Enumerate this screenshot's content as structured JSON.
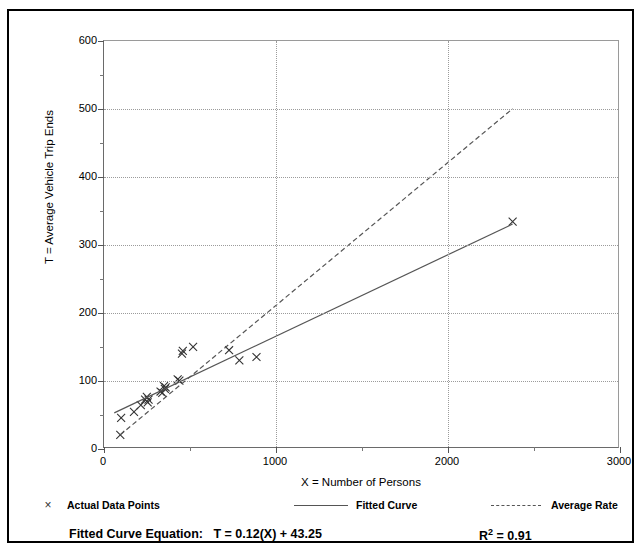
{
  "top_caption": "",
  "chart_data": {
    "type": "scatter",
    "title": "",
    "xlabel": "X = Number of Persons",
    "ylabel": "T = Average Vehicle Trip Ends",
    "xlim": [
      0,
      3000
    ],
    "ylim": [
      0,
      600
    ],
    "x_ticks": [
      0,
      1000,
      2000,
      3000
    ],
    "x_tick_labels": [
      "0",
      "1000",
      "2000",
      "3000"
    ],
    "x_minor_step": 500,
    "y_ticks": [
      0,
      100,
      200,
      300,
      400,
      500,
      600
    ],
    "y_tick_labels": [
      "0",
      "100",
      "200",
      "300",
      "400",
      "500",
      "600"
    ],
    "y_minor_step": 50,
    "grid": "dotted gridlines at major x and y ticks",
    "legend_position": "below-plot",
    "series": [
      {
        "name": "Actual Data Points",
        "type": "scatter",
        "marker": "x",
        "points": [
          [
            95,
            18
          ],
          [
            100,
            43
          ],
          [
            175,
            52
          ],
          [
            215,
            62
          ],
          [
            240,
            70
          ],
          [
            250,
            74
          ],
          [
            255,
            66
          ],
          [
            260,
            70
          ],
          [
            330,
            82
          ],
          [
            340,
            80
          ],
          [
            350,
            90
          ],
          [
            355,
            86
          ],
          [
            360,
            88
          ],
          [
            430,
            100
          ],
          [
            440,
            98
          ],
          [
            455,
            138
          ],
          [
            460,
            142
          ],
          [
            520,
            148
          ],
          [
            730,
            143
          ],
          [
            790,
            128
          ],
          [
            890,
            133
          ],
          [
            2385,
            333
          ]
        ]
      },
      {
        "name": "Fitted Curve",
        "type": "line",
        "style": "solid",
        "equation": "T = 0.12(X) + 43.25",
        "slope": 0.12,
        "intercept": 43.25,
        "x_from": 60,
        "x_to": 2385
      },
      {
        "name": "Average Rate",
        "type": "line",
        "style": "dashed",
        "slope": 0.21,
        "intercept": 0,
        "x_from": 95,
        "x_to": 2385,
        "y_from": 18,
        "y_to": 500
      }
    ]
  },
  "legend": {
    "entries": [
      {
        "label": "Actual Data Points",
        "marker": "x-marker",
        "style": "marker"
      },
      {
        "label": "Fitted Curve",
        "marker": "solid-line",
        "style": "solid"
      },
      {
        "label": "Average Rate",
        "marker": "dashed-line",
        "style": "dashed"
      }
    ],
    "marker_glyph": "×"
  },
  "footer": {
    "equation_label": "Fitted Curve Equation:",
    "equation_value": "T = 0.12(X) + 43.25",
    "r2_label": "R",
    "r2_sup": "2",
    "r2_value": "= 0.91"
  },
  "colors": {
    "frame": "#000000",
    "axis": "#6a6a6a",
    "grid": "#9b9b9b",
    "fitted_line": "#555555",
    "average_line": "#555555",
    "marker": "#333333",
    "background": "#ffffff"
  }
}
